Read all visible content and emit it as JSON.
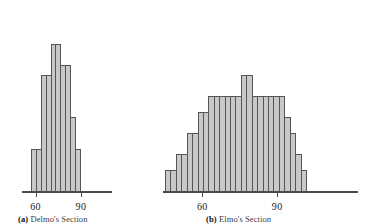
{
  "figure": {
    "background_color": "#ffffff",
    "bar_fill_color": "#c8c8c8",
    "bar_border_color": "#555555",
    "axis_color": "#4a4a4a"
  },
  "chart_data": [
    {
      "type": "bar",
      "title": "",
      "panel_label": "(a)",
      "caption": "Delmo's Section",
      "xlabel": "",
      "ylabel": "",
      "grid": false,
      "legend": "none",
      "xlim": [
        57,
        96
      ],
      "ylim": [
        0,
        30
      ],
      "tick_values": [
        60,
        90
      ],
      "tick_labels": [
        "60",
        "90"
      ],
      "bin_width": 3,
      "bin_starts": [
        60,
        63,
        66,
        69,
        72,
        75,
        78,
        81,
        84,
        87
      ],
      "categories": [
        "60-63",
        "63-66",
        "66-69",
        "69-72",
        "72-75",
        "75-78",
        "78-81",
        "81-84",
        "84-87",
        "87-90"
      ],
      "values": [
        8,
        8,
        22,
        22,
        28,
        28,
        24,
        24,
        14,
        8
      ]
    },
    {
      "type": "bar",
      "title": "",
      "panel_label": "(b)",
      "caption": "Elmo's Section",
      "xlabel": "",
      "ylabel": "",
      "grid": false,
      "legend": "none",
      "xlim": [
        45,
        112
      ],
      "ylim": [
        0,
        30
      ],
      "tick_values": [
        60,
        90
      ],
      "tick_labels": [
        "60",
        "90"
      ],
      "bin_width": 2.5,
      "categories": [
        "b1",
        "b2",
        "b3",
        "b4",
        "b5",
        "b6",
        "b7",
        "b8",
        "b9",
        "b10",
        "b11",
        "b12",
        "b13",
        "b14",
        "b15",
        "b16",
        "b17",
        "b18",
        "b19",
        "b20",
        "b21",
        "b22",
        "b23",
        "b24",
        "b25",
        "b26"
      ],
      "values": [
        4,
        4,
        7,
        7,
        11,
        11,
        15,
        15,
        18,
        18,
        18,
        18,
        18,
        18,
        22,
        22,
        18,
        18,
        18,
        18,
        18,
        18,
        14,
        11,
        7,
        4
      ]
    }
  ],
  "panels": [
    {
      "id": "panel-a",
      "label": "(a)",
      "caption_text": "Delmo's Section",
      "tick_labels": [
        "60",
        "90"
      ]
    },
    {
      "id": "panel-b",
      "label": "(b)",
      "caption_text": "Elmo's Section",
      "tick_labels": [
        "60",
        "90"
      ]
    }
  ]
}
